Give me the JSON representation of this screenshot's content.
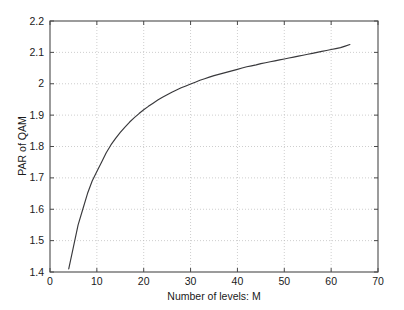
{
  "chart_data": {
    "type": "line",
    "title": "",
    "xlabel": "Number of levels: M",
    "ylabel": "PAR of QAM",
    "xlim": [
      0,
      70
    ],
    "ylim": [
      1.4,
      2.2
    ],
    "grid": true,
    "legend": null,
    "xticks": [
      0,
      10,
      20,
      30,
      40,
      50,
      60,
      70
    ],
    "xticklabels": [
      "0",
      "10",
      "20",
      "30",
      "40",
      "50",
      "60",
      "70"
    ],
    "yticks": [
      1.4,
      1.5,
      1.6,
      1.7,
      1.8,
      1.9,
      2.0,
      2.1,
      2.2
    ],
    "yticklabels": [
      "1.4",
      "1.5",
      "1.6",
      "1.7",
      "1.8",
      "1.9",
      "2",
      "2.1",
      "2.2"
    ],
    "series": [
      {
        "name": "PAR of QAM",
        "color": "#39393c",
        "x": [
          4,
          5,
          6,
          7,
          8,
          9,
          10,
          11,
          12,
          13,
          14,
          15,
          16,
          17,
          18,
          19,
          20,
          21,
          22,
          23,
          24,
          25,
          26,
          27,
          28,
          29,
          30,
          31,
          32,
          33,
          34,
          35,
          36,
          37,
          38,
          39,
          40,
          41,
          42,
          43,
          44,
          45,
          46,
          47,
          48,
          49,
          50,
          51,
          52,
          53,
          54,
          55,
          56,
          57,
          58,
          59,
          60,
          61,
          62,
          63,
          64
        ],
        "y": [
          1.41,
          1.48,
          1.55,
          1.6,
          1.65,
          1.69,
          1.72,
          1.75,
          1.78,
          1.805,
          1.826,
          1.845,
          1.862,
          1.878,
          1.892,
          1.905,
          1.917,
          1.928,
          1.938,
          1.948,
          1.957,
          1.965,
          1.973,
          1.98,
          1.987,
          1.993,
          1.999,
          2.005,
          2.011,
          2.016,
          2.021,
          2.026,
          2.03,
          2.034,
          2.038,
          2.042,
          2.046,
          2.05,
          2.054,
          2.057,
          2.06,
          2.064,
          2.067,
          2.07,
          2.073,
          2.076,
          2.079,
          2.082,
          2.085,
          2.088,
          2.091,
          2.094,
          2.097,
          2.1,
          2.103,
          2.106,
          2.109,
          2.112,
          2.115,
          2.12,
          2.125
        ]
      }
    ]
  }
}
